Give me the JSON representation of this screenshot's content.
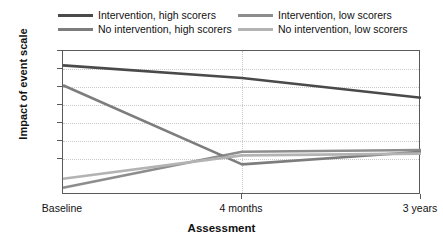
{
  "chart_data": {
    "type": "line",
    "title": "",
    "xlabel": "Assessment",
    "ylabel": "Impact of event scale",
    "categories": [
      "Baseline",
      "4 months",
      "3 years"
    ],
    "ylim": [
      0,
      40
    ],
    "yticks": [
      40,
      35,
      30,
      25,
      20,
      15,
      10,
      0
    ],
    "ytick_labels": [
      "40",
      "35",
      "30",
      "25",
      "20",
      "15",
      "10",
      "0"
    ],
    "grid": "dotted-light",
    "legend_position": "top",
    "series": [
      {
        "name": "Intervention, high scorers",
        "color": "#4a4a4a",
        "values": [
          36,
          32.5,
          27
        ]
      },
      {
        "name": "Intervention, low scorers",
        "color": "#8d8d8d",
        "values": [
          2,
          12,
          12.5
        ]
      },
      {
        "name": "No intervention, high scorers",
        "color": "#7d7d7d",
        "values": [
          30.5,
          8.5,
          12
        ]
      },
      {
        "name": "No intervention, low scorers",
        "color": "#b3b3b3",
        "values": [
          4.5,
          11,
          11.5
        ]
      }
    ]
  },
  "legend": {
    "items": [
      {
        "label": "Intervention, high scorers",
        "color": "#4a4a4a"
      },
      {
        "label": "Intervention, low scorers",
        "color": "#8d8d8d"
      },
      {
        "label": "No intervention, high scorers",
        "color": "#7d7d7d"
      },
      {
        "label": "No intervention, low scorers",
        "color": "#b3b3b3"
      }
    ]
  },
  "axes": {
    "y_title": "Impact of event scale",
    "x_title": "Assessment",
    "y_labels": [
      "40",
      "35",
      "30",
      "25",
      "20",
      "15",
      "10",
      "0"
    ],
    "x_labels": [
      "Baseline",
      "4 months",
      "3 years"
    ]
  }
}
